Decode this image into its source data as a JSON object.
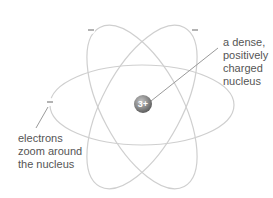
{
  "diagram": {
    "type": "atom-model",
    "nucleus": {
      "charge_label": "3+",
      "color": "#8a8a8a"
    },
    "electrons": [
      {
        "symbol": "–",
        "position": "top-left orbit"
      },
      {
        "symbol": "–",
        "position": "top-right orbit"
      },
      {
        "symbol": "–",
        "position": "left horizontal orbit"
      }
    ],
    "orbit_color": "#c8c8c8",
    "labels": {
      "nucleus": [
        "a dense,",
        "positively",
        "charged",
        "nucleus"
      ],
      "electrons": [
        "electrons",
        "zoom around",
        "the nucleus"
      ]
    }
  }
}
